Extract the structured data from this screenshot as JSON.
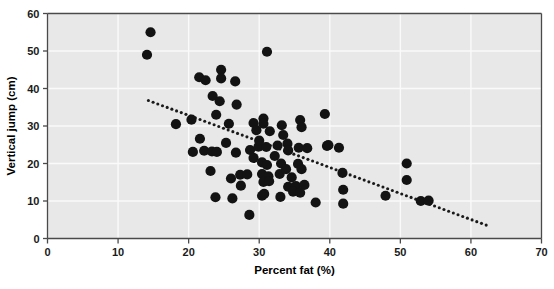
{
  "chart_data": {
    "type": "scatter",
    "title": "",
    "xlabel": "Percent fat (%)",
    "ylabel": "Vertical jump (cm)",
    "xlim": [
      0,
      70
    ],
    "ylim": [
      0,
      60
    ],
    "xticks": [
      0,
      10,
      20,
      30,
      40,
      50,
      60,
      70
    ],
    "yticks": [
      0,
      10,
      20,
      30,
      40,
      50,
      60
    ],
    "xtick_labels": [
      "0",
      "10",
      "20",
      "30",
      "40",
      "50",
      "60",
      "70"
    ],
    "ytick_labels": [
      "0",
      "10",
      "20",
      "30",
      "40",
      "50",
      "60"
    ],
    "grid": true,
    "grid_color": "#fafafa",
    "plot_background": "#e8e8e8",
    "legend": null,
    "marker_color": "#131313",
    "marker_size": 5.1,
    "annotations": [],
    "trendline": {
      "style": "dotted",
      "color": "#1a1a1a",
      "x_start": 14.3,
      "y_start": 36.8,
      "x_end": 62.7,
      "y_end": 3.2
    },
    "points": [
      [
        14.6,
        55.0
      ],
      [
        14.1,
        49.0
      ],
      [
        21.5,
        43.0
      ],
      [
        24.6,
        45.0
      ],
      [
        22.4,
        42.2
      ],
      [
        24.6,
        42.7
      ],
      [
        26.6,
        41.9
      ],
      [
        31.1,
        49.8
      ],
      [
        23.4,
        38.0
      ],
      [
        24.4,
        36.6
      ],
      [
        26.8,
        35.7
      ],
      [
        23.9,
        33.0
      ],
      [
        18.2,
        30.5
      ],
      [
        20.4,
        31.7
      ],
      [
        25.7,
        30.6
      ],
      [
        29.2,
        30.8
      ],
      [
        30.6,
        32.0
      ],
      [
        30.6,
        30.6
      ],
      [
        29.6,
        28.9
      ],
      [
        31.5,
        28.6
      ],
      [
        33.2,
        30.2
      ],
      [
        33.4,
        27.6
      ],
      [
        34.0,
        25.3
      ],
      [
        39.3,
        33.2
      ],
      [
        35.8,
        31.6
      ],
      [
        36.0,
        29.7
      ],
      [
        21.6,
        26.6
      ],
      [
        20.6,
        23.1
      ],
      [
        22.2,
        23.4
      ],
      [
        23.3,
        23.2
      ],
      [
        24.0,
        23.1
      ],
      [
        25.3,
        25.5
      ],
      [
        26.7,
        22.9
      ],
      [
        28.7,
        23.6
      ],
      [
        29.9,
        24.5
      ],
      [
        31.0,
        24.4
      ],
      [
        32.6,
        24.8
      ],
      [
        34.1,
        23.5
      ],
      [
        35.6,
        24.2
      ],
      [
        36.8,
        24.1
      ],
      [
        39.6,
        24.7
      ],
      [
        39.8,
        24.9
      ],
      [
        41.3,
        24.2
      ],
      [
        23.1,
        18.0
      ],
      [
        26.0,
        16.0
      ],
      [
        27.3,
        17.0
      ],
      [
        28.3,
        17.1
      ],
      [
        27.4,
        14.1
      ],
      [
        30.4,
        20.3
      ],
      [
        31.1,
        19.6
      ],
      [
        30.4,
        17.2
      ],
      [
        31.3,
        16.6
      ],
      [
        30.6,
        15.1
      ],
      [
        31.4,
        15.3
      ],
      [
        32.9,
        17.2
      ],
      [
        33.1,
        20.0
      ],
      [
        33.8,
        18.5
      ],
      [
        34.6,
        16.3
      ],
      [
        35.5,
        19.9
      ],
      [
        36.0,
        18.5
      ],
      [
        34.1,
        13.8
      ],
      [
        35.2,
        14.0
      ],
      [
        36.4,
        14.3
      ],
      [
        23.8,
        11.0
      ],
      [
        26.2,
        10.7
      ],
      [
        28.6,
        6.3
      ],
      [
        30.4,
        11.4
      ],
      [
        30.7,
        11.9
      ],
      [
        33.0,
        11.1
      ],
      [
        34.8,
        12.5
      ],
      [
        35.8,
        12.2
      ],
      [
        38.0,
        9.6
      ],
      [
        41.8,
        17.5
      ],
      [
        41.9,
        13.0
      ],
      [
        41.9,
        9.3
      ],
      [
        50.9,
        20.0
      ],
      [
        50.9,
        15.6
      ],
      [
        47.9,
        11.4
      ],
      [
        52.9,
        10.0
      ],
      [
        54.0,
        10.1
      ],
      [
        29.2,
        21.5
      ],
      [
        32.2,
        22.0
      ],
      [
        30.0,
        26.1
      ]
    ]
  }
}
